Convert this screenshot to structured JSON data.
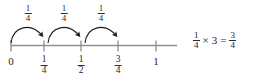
{
  "figure": {
    "type": "number-line-diagram",
    "title_visible": false,
    "background_color": "#ffffff",
    "ink_color": "#1f1f1f",
    "line_color": "#8a8a8a"
  },
  "number_line": {
    "start_value": "0",
    "end_value": "1",
    "ticks": [
      {
        "value": "0",
        "label_kind": "whole",
        "label": "0",
        "x": 11
      },
      {
        "value": "1/4",
        "label_kind": "fraction",
        "numerator": "1",
        "denominator": "4",
        "x": 44
      },
      {
        "value": "1/2",
        "label_kind": "fraction",
        "numerator": "1",
        "denominator": "2",
        "x": 81
      },
      {
        "value": "3/4",
        "label_kind": "fraction",
        "numerator": "3",
        "denominator": "4",
        "x": 118
      },
      {
        "value": "1",
        "label_kind": "whole",
        "label": "1",
        "x": 156
      }
    ]
  },
  "jumps": [
    {
      "label_numerator": "1",
      "label_denominator": "4",
      "from_x": 11,
      "to_x": 44,
      "label_x": 28
    },
    {
      "label_numerator": "1",
      "label_denominator": "4",
      "from_x": 48,
      "to_x": 81,
      "label_x": 64
    },
    {
      "label_numerator": "1",
      "label_denominator": "4",
      "from_x": 85,
      "to_x": 118,
      "label_x": 101
    }
  ],
  "equation": {
    "left_numerator": "1",
    "left_denominator": "4",
    "times_symbol": "×",
    "multiplier": "3",
    "equals_symbol": "=",
    "result_numerator": "3",
    "result_denominator": "4",
    "plain_text": "1/4 × 3 = 3/4"
  }
}
